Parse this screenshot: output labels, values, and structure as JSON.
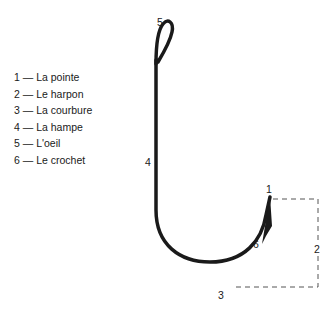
{
  "legend": {
    "items": [
      {
        "num": "1",
        "sep": "—",
        "label": "La pointe"
      },
      {
        "num": "2",
        "sep": "—",
        "label": "Le harpon"
      },
      {
        "num": "3",
        "sep": "—",
        "label": "La courbure"
      },
      {
        "num": "4",
        "sep": "—",
        "label": "La hampe"
      },
      {
        "num": "5",
        "sep": "—",
        "label": "L'oeil"
      },
      {
        "num": "6",
        "sep": "—",
        "label": "Le crochet"
      }
    ]
  },
  "callouts": {
    "point": "1",
    "barb_height": "2",
    "bend": "3",
    "shank": "4",
    "eye": "5",
    "barb": "6"
  },
  "colors": {
    "ink": "#1a1a1a",
    "dashes": "#555555",
    "background": "#ffffff"
  }
}
